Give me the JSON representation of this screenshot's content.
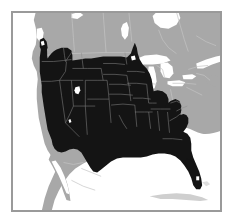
{
  "figure": {
    "type": "range-map",
    "title": "",
    "caption": "",
    "region": "North America",
    "projection_hint": "conic"
  },
  "legend": {
    "entries": [
      {
        "key": "range",
        "label": "Species range",
        "color": "#141414"
      },
      {
        "key": "land",
        "label": "Land outside range",
        "color": "#a8a8a8"
      },
      {
        "key": "water",
        "label": "Water / ocean",
        "color": "#ffffff"
      },
      {
        "key": "border",
        "label": "Political boundary",
        "color": "#c9c9c9"
      }
    ],
    "visible": false
  },
  "frame": {
    "border_color": "#9a9a9a",
    "border_width_px": 1,
    "background": "#ffffff"
  },
  "colors": {
    "range_fill": "#141414",
    "land_fill": "#a8a8a8",
    "water_fill": "#ffffff",
    "state_line": "#b5b5b5",
    "province_line": "#c4c4c4",
    "range_state_line": "#5a5a5a",
    "frame": "#9a9a9a",
    "far_land": "#cfcfcf"
  },
  "features": {
    "land_labels": [],
    "water_labels": [],
    "annotations": []
  },
  "range_regions": {
    "included": [
      "Washington",
      "Oregon",
      "California",
      "Idaho",
      "Nevada",
      "Utah",
      "Arizona",
      "Montana",
      "Wyoming",
      "Colorado",
      "New Mexico",
      "North Dakota",
      "South Dakota",
      "Nebraska",
      "Kansas",
      "Oklahoma",
      "Texas",
      "Minnesota (west)",
      "Iowa",
      "Missouri",
      "Arkansas",
      "Louisiana",
      "Mississippi",
      "Alabama",
      "Georgia",
      "Florida",
      "South Carolina",
      "North Carolina (west)",
      "Tennessee",
      "Virginia (west)",
      "West Virginia"
    ],
    "excluded": [
      "Maine",
      "New Hampshire",
      "Vermont",
      "New York",
      "Massachusetts",
      "Connecticut",
      "Rhode Island",
      "Pennsylvania",
      "New Jersey",
      "Maryland",
      "Delaware",
      "Ohio",
      "Michigan",
      "Indiana",
      "Illinois",
      "Wisconsin",
      "Kentucky",
      "Canada",
      "Mexico"
    ]
  }
}
